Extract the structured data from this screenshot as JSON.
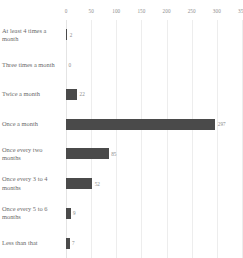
{
  "chart_data": {
    "type": "bar",
    "orientation": "horizontal",
    "title": "",
    "subtitle": "",
    "xlabel": "",
    "ylabel": "",
    "categories": [
      "At least 4 times a month",
      "Three times a month",
      "Twice a month",
      "Once a month",
      "Once every two months",
      "Once every 3 to 4 months",
      "Once every 5 to 6 months",
      "Less than that"
    ],
    "values": [
      2,
      0,
      22,
      297,
      85,
      52,
      9,
      7
    ],
    "value_labels": [
      "2",
      "0",
      "22",
      "297",
      "85",
      "52",
      "9",
      "7"
    ],
    "xticks": [
      0,
      50,
      100,
      150,
      200,
      250,
      300,
      350
    ],
    "xtick_labels": [
      "0",
      "50",
      "100",
      "150",
      "200",
      "250",
      "300",
      "350"
    ],
    "xlim": [
      0,
      350
    ],
    "grid": true,
    "grid_axis": "x",
    "legend": false,
    "axis_position": "top",
    "bar_color": "#4a4a4a",
    "grid_color": "#ededed",
    "text_color": "#6b6b6b",
    "tick_color": "#8d8d8d",
    "background": "#ffffff"
  }
}
